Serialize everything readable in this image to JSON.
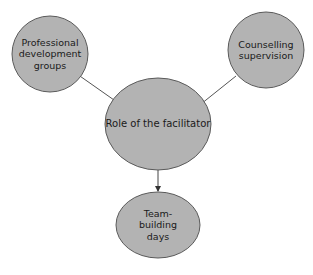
{
  "diagram": {
    "type": "concept-map",
    "colors": {
      "node_fill": "#b3b3b3",
      "node_stroke": "#5a5a5a",
      "connector": "#555555",
      "background": "#ffffff"
    },
    "nodes": {
      "center": {
        "label": "Role of the facilitator"
      },
      "top_left": {
        "label": "Professional development groups",
        "lines": [
          "Professional",
          "development",
          "groups"
        ]
      },
      "top_right": {
        "label": "Counselling supervision",
        "lines": [
          "Counselling",
          "supervision"
        ]
      },
      "bottom": {
        "label": "Team-building days",
        "lines": [
          "Team-",
          "building",
          "days"
        ]
      }
    },
    "edges": [
      {
        "from": "top_left",
        "to": "center",
        "arrow": false
      },
      {
        "from": "top_right",
        "to": "center",
        "arrow": false
      },
      {
        "from": "center",
        "to": "bottom",
        "arrow": true
      }
    ]
  }
}
